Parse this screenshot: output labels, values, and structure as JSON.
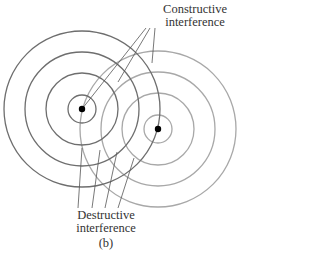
{
  "diagram": {
    "labels": {
      "constructive_line1": "Constructive",
      "constructive_line2": "interference",
      "destructive_line1": "Destructive",
      "destructive_line2": "interference",
      "caption": "(b)"
    },
    "sources": [
      {
        "name": "source-1",
        "cx": 82,
        "cy": 109,
        "radii": [
          14,
          36,
          57,
          78
        ],
        "stroke": "#6e6e6e"
      },
      {
        "name": "source-2",
        "cx": 158,
        "cy": 129,
        "radii": [
          14,
          36,
          57,
          78
        ],
        "stroke": "#a8a8a8"
      }
    ],
    "colors": {
      "dot": "#000000",
      "leader": "#555555",
      "text": "#333333"
    }
  }
}
